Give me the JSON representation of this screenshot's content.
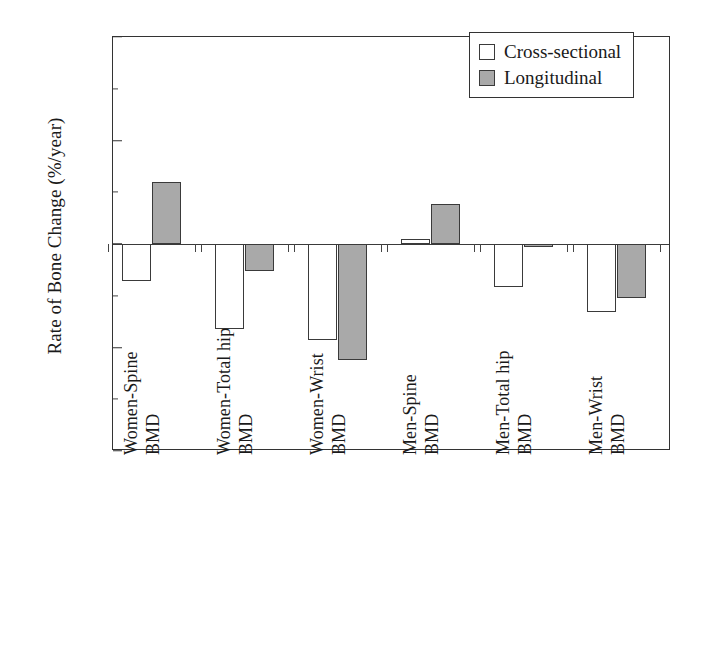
{
  "chart_data": {
    "type": "bar",
    "title": "",
    "xlabel": "",
    "ylabel": "Rate of Bone Change (%/year)",
    "ylim": [
      -2,
      2
    ],
    "ytick_labels": [
      "2",
      "1",
      "0",
      "-1",
      "-2"
    ],
    "ytick_values": [
      2,
      1,
      0,
      -1,
      -2
    ],
    "yminor_values": [
      1.5,
      0.5,
      -0.5,
      -1.5
    ],
    "grid": false,
    "legend_position": "top-right",
    "categories": [
      "Women-Spine BMD",
      "Women-Total hip BMD",
      "Women-Wrist BMD",
      "Men-Spine BMD",
      "Men-Total hip BMD",
      "Men-Wrist BMD"
    ],
    "series": [
      {
        "name": "Cross-sectional",
        "color": "#ffffff",
        "values": [
          -0.36,
          -0.82,
          -0.93,
          0.05,
          -0.42,
          -0.66
        ]
      },
      {
        "name": "Longitudinal",
        "color": "#a9a9a9",
        "values": [
          0.6,
          -0.26,
          -1.12,
          0.39,
          -0.03,
          -0.52
        ]
      }
    ]
  },
  "legend": {
    "items": [
      {
        "label": "Cross-sectional",
        "swatch": "open-square-swatch"
      },
      {
        "label": "Longitudinal",
        "swatch": "filled-square-swatch"
      }
    ]
  },
  "axes": {
    "y_title": "Rate of Bone Change (%/year)"
  }
}
